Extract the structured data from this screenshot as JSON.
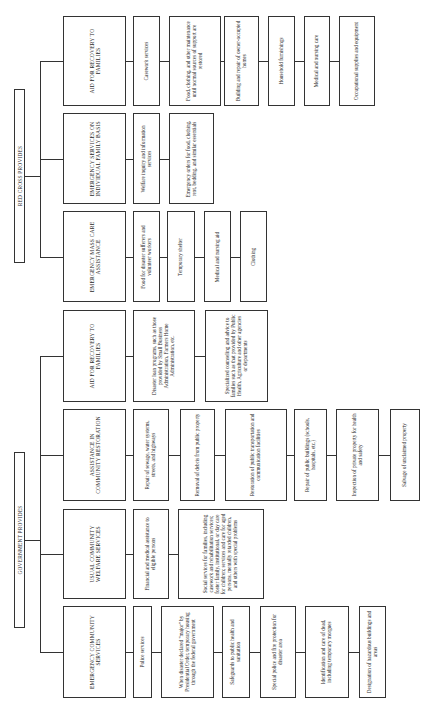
{
  "diagram": {
    "roots": [
      {
        "label": "RED CROSS PROVIDES",
        "x": 14,
        "y": 89,
        "w": 11,
        "h": 174
      },
      {
        "label": "GOVERNMENT PROVIDES",
        "x": 14,
        "y": 452,
        "w": 11,
        "h": 176
      }
    ],
    "categories": [
      {
        "label": "AID FOR RECOVERY TO FAMILIES",
        "provider": "RED CROSS PROVIDES",
        "x": 63,
        "y": 16,
        "w": 63,
        "h": 90
      },
      {
        "label": "EMERGENCY SERVICES ON INDIVIDUAL FAMILY BASIS",
        "provider": "RED CROSS PROVIDES",
        "x": 63,
        "y": 113,
        "w": 63,
        "h": 91
      },
      {
        "label": "EMERGENCY MASS CARE ASSISTANCE",
        "provider": "RED CROSS PROVIDES",
        "x": 63,
        "y": 211,
        "w": 63,
        "h": 91
      },
      {
        "label": "AID FOR RECOVERY TO FAMILIES",
        "provider": "GOVERNMENT PROVIDES",
        "x": 63,
        "y": 310,
        "w": 63,
        "h": 92
      },
      {
        "label": "ASSISTANCE IN COMMUNITY RESTORATION",
        "provider": "GOVERNMENT PROVIDES",
        "x": 63,
        "y": 409,
        "w": 63,
        "h": 92
      },
      {
        "label": "USUAL COMMUNITY WELFARE SERVICES",
        "provider": "GOVERNMENT PROVIDES",
        "x": 63,
        "y": 509,
        "w": 63,
        "h": 90
      },
      {
        "label": "EMERGENCY COMMUNITY SERVICES",
        "provider": "GOVERNMENT PROVIDES",
        "x": 63,
        "y": 606,
        "w": 63,
        "h": 92
      }
    ],
    "leaves": [
      [
        {
          "label": "Casework services",
          "x": 133,
          "w": 27
        },
        {
          "label": "Food, clothing, and other maintenance until normal sources of support are restored",
          "x": 169,
          "w": 52
        },
        {
          "label": "Building and repair of owner-occupied homes",
          "x": 224,
          "w": 35
        },
        {
          "label": "Household furnishings",
          "x": 268,
          "w": 27
        },
        {
          "label": "Medical and nursing care",
          "x": 304,
          "w": 26
        },
        {
          "label": "Occupational supplies and equipment",
          "x": 339,
          "w": 36
        }
      ],
      [
        {
          "label": "Welfare inquiry and information services",
          "x": 133,
          "w": 27
        },
        {
          "label": "Emergency orders for food, clothing, rent, bedding, and similar essentials",
          "x": 169,
          "w": 45
        }
      ],
      [
        {
          "label": "Food for disaster sufferers and volunteer workers",
          "x": 133,
          "w": 27
        },
        {
          "label": "Temporary shelter",
          "x": 167,
          "w": 28
        },
        {
          "label": "Medical and nursing aid",
          "x": 204,
          "w": 27
        },
        {
          "label": "Clothing",
          "x": 240,
          "w": 27
        }
      ],
      [
        {
          "label": "Disaster loan programs, such as those provided by Small Business Administration, Farmers Home Administration, etc.",
          "x": 133,
          "w": 62
        },
        {
          "label": "Specialized counseling and advice to families such as that provided by Public Health, Agriculture and other agencies or departments",
          "x": 205,
          "w": 63
        }
      ],
      [
        {
          "label": "Repair of sewage, water systems, streets, and highways",
          "x": 133,
          "w": 36
        },
        {
          "label": "Removal of debris from public property",
          "x": 180,
          "w": 35
        },
        {
          "label": "Restoration of public transportation and communication facilities",
          "x": 225,
          "w": 62
        },
        {
          "label": "Repair of public buildings (schools, hospitals, etc.)",
          "x": 294,
          "w": 33
        },
        {
          "label": "Inspection of private property for health and safety",
          "x": 336,
          "w": 43
        },
        {
          "label": "Salvage of unclaimed property",
          "x": 390,
          "w": 30
        }
      ],
      [
        {
          "label": "Financial and medical assistance to eligible persons",
          "x": 133,
          "w": 36
        },
        {
          "label": "Social services for families, including casework and rehabilitation services; foster family, institutional, or day care for children; services and care for aged persons, mentally retarded children, and others with special problems",
          "x": 178,
          "w": 86
        }
      ],
      [
        {
          "label": "Police services",
          "x": 133,
          "w": 19
        },
        {
          "label": "When disaster declared \"major\" by Presidential Order, temporary housing through the federal government",
          "x": 161,
          "w": 53
        },
        {
          "label": "Safeguards to public health and sanitation",
          "x": 222,
          "w": 28
        },
        {
          "label": "Special police and fire protection for disaster area",
          "x": 260,
          "w": 36
        },
        {
          "label": "Identification and care of dead, including temporary morgues",
          "x": 305,
          "w": 44
        },
        {
          "label": "Designation of hazardous buildings and areas",
          "x": 359,
          "w": 27
        }
      ]
    ]
  }
}
